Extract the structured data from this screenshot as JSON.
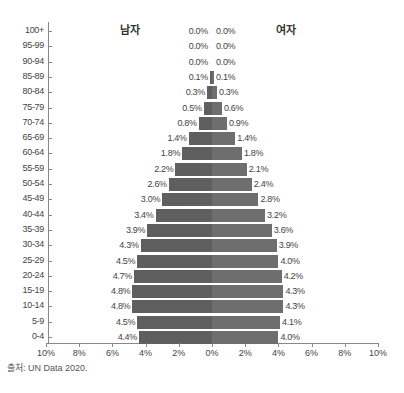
{
  "chart_data": {
    "type": "bar",
    "orientation": "horizontal-pyramid",
    "title": "",
    "categories": [
      "100+",
      "95-99",
      "90-94",
      "85-89",
      "80-84",
      "75-79",
      "70-74",
      "65-69",
      "60-64",
      "55-59",
      "50-54",
      "45-49",
      "40-44",
      "35-39",
      "30-34",
      "25-29",
      "20-24",
      "15-19",
      "10-14",
      "5-9",
      "0-4"
    ],
    "series": [
      {
        "name": "남자",
        "values": [
          0.0,
          0.0,
          0.0,
          0.1,
          0.3,
          0.5,
          0.8,
          1.4,
          1.8,
          2.2,
          2.6,
          3.0,
          3.4,
          3.9,
          4.3,
          4.5,
          4.7,
          4.8,
          4.8,
          4.5,
          4.4
        ],
        "labels": [
          "0.0%",
          "0.0%",
          "0.0%",
          "0.1%",
          "0.3%",
          "0.5%",
          "0.8%",
          "1.4%",
          "1.8%",
          "2.2%",
          "2.6%",
          "3.0%",
          "3.4%",
          "3.9%",
          "4.3%",
          "4.5%",
          "4.7%",
          "4.8%",
          "4.8%",
          "4.5%",
          "4.4%"
        ]
      },
      {
        "name": "여자",
        "values": [
          0.0,
          0.0,
          0.0,
          0.1,
          0.3,
          0.6,
          0.9,
          1.4,
          1.8,
          2.1,
          2.4,
          2.8,
          3.2,
          3.6,
          3.9,
          4.0,
          4.2,
          4.3,
          4.3,
          4.1,
          4.0
        ],
        "labels": [
          "0.0%",
          "0.0%",
          "0.0%",
          "0.1%",
          "0.3%",
          "0.6%",
          "0.9%",
          "1.4%",
          "1.8%",
          "2.1%",
          "2.4%",
          "2.8%",
          "3.2%",
          "3.6%",
          "3.9%",
          "4.0%",
          "4.2%",
          "4.3%",
          "4.3%",
          "4.1%",
          "4.0%"
        ]
      }
    ],
    "xlabel": "",
    "ylabel": "",
    "xticks": [
      "10%",
      "8%",
      "6%",
      "4%",
      "2%",
      "0%",
      "2%",
      "4%",
      "6%",
      "8%",
      "10%"
    ],
    "xlim": [
      -10,
      10
    ],
    "grid": false,
    "legend": "inline labels: 남자 (left), 여자 (right)",
    "colors": {
      "male": "#5f5f5f",
      "female": "#6e6e6e"
    }
  },
  "labels": {
    "male": "남자",
    "female": "여자",
    "source": "출처: UN Data 2020."
  }
}
